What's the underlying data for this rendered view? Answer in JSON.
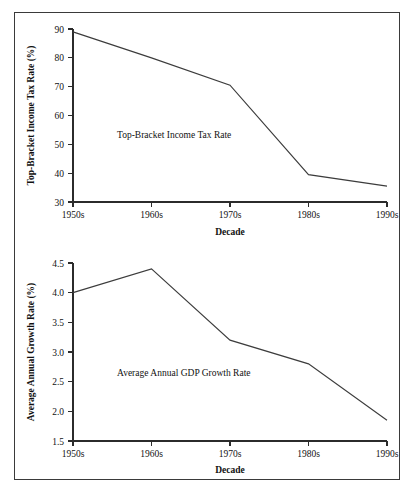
{
  "figure": {
    "background_color": "#ffffff",
    "border_color": "#3a3a3a",
    "line_color": "#3c3c3c"
  },
  "chart_data": [
    {
      "type": "line",
      "id": "top-bracket-income-tax-rate",
      "title": "",
      "xlabel": "Decade",
      "ylabel": "Top-Bracket Income Tax Rate (%)",
      "categories": [
        "1950s",
        "1960s",
        "1970s",
        "1980s",
        "1990s"
      ],
      "values": [
        89,
        80,
        70.5,
        39.5,
        35.5
      ],
      "series": [
        {
          "name": "Top-Bracket Income Tax Rate",
          "values": [
            89,
            80,
            70.5,
            39.5,
            35.5
          ]
        }
      ],
      "ylim": [
        30,
        90
      ],
      "yticks": [
        30,
        40,
        50,
        60,
        70,
        80,
        90
      ],
      "ytick_labels": [
        "30",
        "40",
        "50",
        "60",
        "70",
        "80",
        "90"
      ],
      "xtick_labels": [
        "1950s",
        "1960s",
        "1970s",
        "1980s",
        "1990s"
      ],
      "annotation": "Top-Bracket Income Tax Rate",
      "grid": false,
      "legend": "none"
    },
    {
      "type": "line",
      "id": "average-annual-gdp-growth-rate",
      "title": "",
      "xlabel": "Decade",
      "ylabel": "Average Annual Growth Rate (%)",
      "categories": [
        "1950s",
        "1960s",
        "1970s",
        "1980s",
        "1990s"
      ],
      "values": [
        4.0,
        4.4,
        3.2,
        2.8,
        1.85
      ],
      "series": [
        {
          "name": "Average Annual GDP Growth Rate",
          "values": [
            4.0,
            4.4,
            3.2,
            2.8,
            1.85
          ]
        }
      ],
      "ylim": [
        1.5,
        4.5
      ],
      "yticks": [
        1.5,
        2.0,
        2.5,
        3.0,
        3.5,
        4.0,
        4.5
      ],
      "ytick_labels": [
        "1.5",
        "2.0",
        "2.5",
        "3.0",
        "3.5",
        "4.0",
        "4.5"
      ],
      "xtick_labels": [
        "1950s",
        "1960s",
        "1970s",
        "1980s",
        "1990s"
      ],
      "annotation": "Average Annual GDP Growth Rate",
      "grid": false,
      "legend": "none"
    }
  ]
}
